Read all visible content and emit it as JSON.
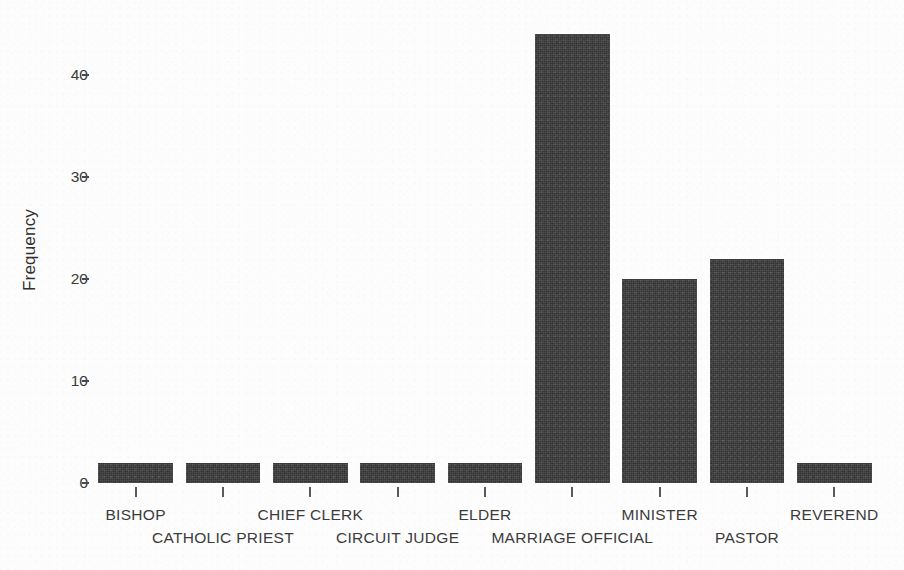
{
  "chart_data": {
    "type": "bar",
    "title": "",
    "xlabel": "",
    "ylabel": "Frequency",
    "categories": [
      "BISHOP",
      "CATHOLIC PRIEST",
      "CHIEF CLERK",
      "CIRCUIT JUDGE",
      "ELDER",
      "MARRIAGE OFFICIAL",
      "MINISTER",
      "PASTOR",
      "REVEREND"
    ],
    "values": [
      2,
      2,
      2,
      2,
      2,
      44,
      20,
      22,
      2
    ],
    "ylim": [
      0,
      46
    ],
    "yticks": [
      0,
      10,
      20,
      30,
      40
    ],
    "ytick_labels": [
      "0",
      "10",
      "20",
      "30",
      "40"
    ],
    "grid": false,
    "legend": false,
    "legend_position": "none",
    "bar_color": "#3a3a3a",
    "background_color": "#fdfdfd",
    "axis_color": "#4a4a4a",
    "label_rows": [
      0,
      1,
      0,
      1,
      0,
      1,
      0,
      1,
      0
    ]
  }
}
